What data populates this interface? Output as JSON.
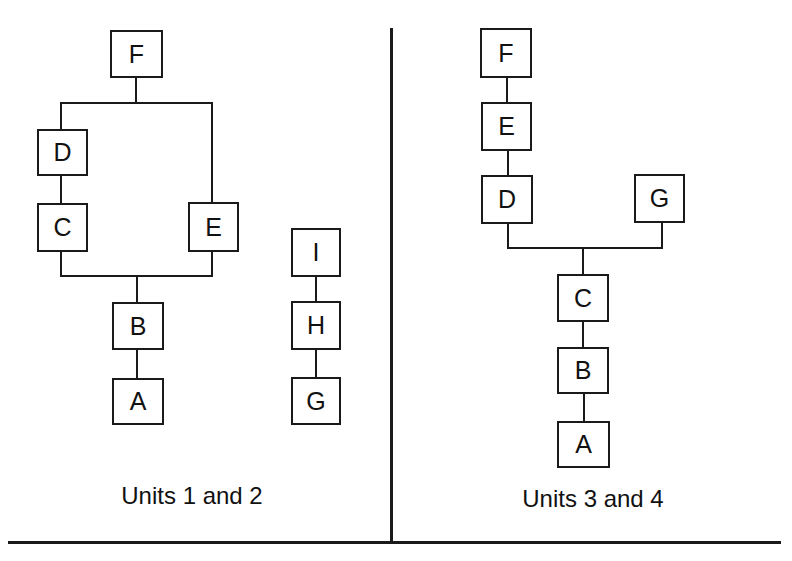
{
  "left_panel": {
    "caption": "Units 1 and 2",
    "nodes": {
      "F": "F",
      "D": "D",
      "C": "C",
      "E": "E",
      "B": "B",
      "A": "A",
      "I": "I",
      "H": "H",
      "G": "G"
    }
  },
  "right_panel": {
    "caption": "Units 3 and 4",
    "nodes": {
      "F": "F",
      "E": "E",
      "D": "D",
      "G": "G",
      "C": "C",
      "B": "B",
      "A": "A"
    }
  },
  "colors": {
    "line": "#1a1a1a",
    "background": "#ffffff"
  }
}
